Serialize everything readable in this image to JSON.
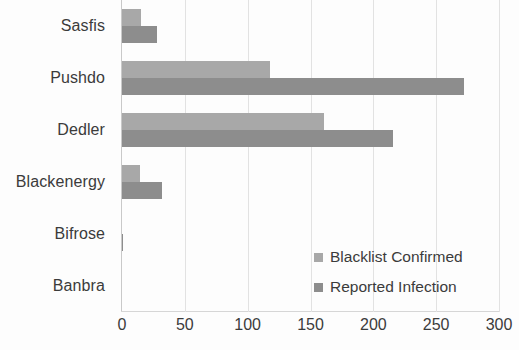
{
  "chart_data": {
    "type": "bar",
    "orientation": "horizontal",
    "title": "",
    "xlabel": "",
    "ylabel": "",
    "categories": [
      "Sasfis",
      "Pushdo",
      "Dedler",
      "Blackenergy",
      "Bifrose",
      "Banbra"
    ],
    "series": [
      {
        "name": "Blacklist Confirmed",
        "color": "#a8a8a8",
        "values": [
          15,
          118,
          161,
          14,
          0,
          0
        ]
      },
      {
        "name": "Reported Infection",
        "color": "#8d8d8d",
        "values": [
          28,
          272,
          216,
          32,
          1,
          0
        ]
      }
    ],
    "xlim": [
      0,
      300
    ],
    "xticks": [
      0,
      50,
      100,
      150,
      200,
      250,
      300
    ],
    "xtick_labels": [
      "0",
      "50",
      "100",
      "150",
      "200",
      "250",
      "300"
    ],
    "grid": true,
    "grid_axis": "x",
    "legend_position": "inside-bottom-right",
    "legend_entries": [
      "Blacklist Confirmed",
      "Reported Infection"
    ]
  }
}
